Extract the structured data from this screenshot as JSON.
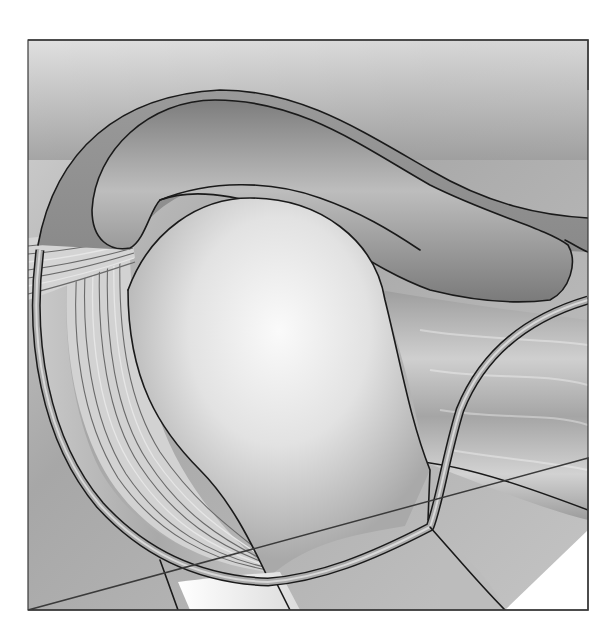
{
  "figure": {
    "type": "anatomical-illustration",
    "style": "grayscale airbrush illustration",
    "frame": {
      "x": 28,
      "y": 40,
      "width": 560,
      "height": 570,
      "border_color": "#3a3a3a"
    },
    "structures": [
      {
        "name": "acromion",
        "shade": "#8f8f8f"
      },
      {
        "name": "humeral-head",
        "shade": "#e8e8e8"
      },
      {
        "name": "humeral-shaft",
        "shade": "#f2f2f2"
      },
      {
        "name": "subacromial-bursa",
        "shade": "#a8a8a8"
      },
      {
        "name": "supraspinatus-tendon",
        "shade": "#c8c8c8"
      },
      {
        "name": "biceps-tendon-fibers",
        "shade": "#d0d0d0"
      },
      {
        "name": "joint-capsule",
        "shade": "#9a9a9a"
      },
      {
        "name": "deltoid-muscle",
        "shade": "#b4b4b4"
      },
      {
        "name": "glenoid-region",
        "shade": "#c0c0c0"
      }
    ],
    "colors": {
      "background": "#ffffff",
      "surround": "#b9b9b9",
      "outline": "#1a1a1a"
    }
  }
}
